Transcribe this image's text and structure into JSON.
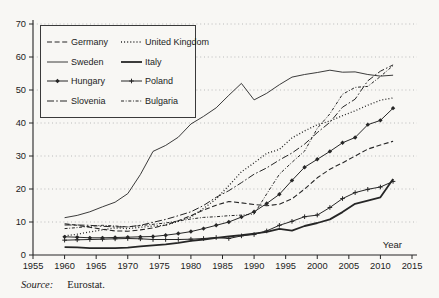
{
  "figure": {
    "source_label": "Source:",
    "source_value": "Eurostat.",
    "ink_color": "#262626",
    "grid_color": "#b3b3b3",
    "background": "#f8f7f4"
  },
  "chart_data": {
    "type": "line",
    "title": "",
    "xlabel": "Year",
    "ylabel": "",
    "xlim": [
      1955,
      2015
    ],
    "ylim": [
      0,
      70
    ],
    "x_ticks": [
      1955,
      1960,
      1965,
      1970,
      1975,
      1980,
      1985,
      1990,
      1995,
      2000,
      2005,
      2010,
      2015
    ],
    "y_ticks": [
      0,
      10,
      20,
      30,
      40,
      50,
      60,
      70
    ],
    "grid": "horizontal-dotted",
    "legend_position": "upper-left",
    "x": [
      1960,
      1962,
      1964,
      1966,
      1968,
      1970,
      1972,
      1974,
      1976,
      1978,
      1980,
      1982,
      1984,
      1986,
      1988,
      1990,
      1992,
      1994,
      1996,
      1998,
      2000,
      2002,
      2004,
      2006,
      2008,
      2010,
      2012
    ],
    "series": [
      {
        "name": "Germany",
        "style": "dashed",
        "marker": "none",
        "values": [
          9.5,
          9.0,
          8.4,
          7.8,
          7.3,
          7.2,
          7.6,
          8.2,
          9.1,
          10.4,
          11.9,
          13.6,
          15.1,
          16.2,
          15.8,
          15.3,
          14.9,
          15.4,
          17.0,
          20.0,
          23.4,
          26.0,
          27.9,
          30.0,
          32.1,
          33.3,
          34.5
        ]
      },
      {
        "name": "United Kingdom",
        "style": "dotted",
        "marker": "none",
        "values": [
          5.8,
          6.3,
          7.0,
          7.6,
          8.2,
          8.0,
          8.4,
          8.8,
          9.0,
          10.2,
          11.5,
          14.1,
          17.0,
          21.0,
          25.2,
          27.9,
          30.8,
          32.0,
          35.5,
          37.6,
          39.5,
          40.6,
          42.2,
          43.7,
          45.4,
          46.9,
          47.6
        ]
      },
      {
        "name": "Sweden",
        "style": "solid-thin",
        "marker": "none",
        "values": [
          11.3,
          12.0,
          13.1,
          14.6,
          16.0,
          18.6,
          24.4,
          31.4,
          33.2,
          35.7,
          39.7,
          42.0,
          44.6,
          48.4,
          52.0,
          47.0,
          49.0,
          51.6,
          53.9,
          54.7,
          55.3,
          56.0,
          55.4,
          55.5,
          54.7,
          54.2,
          54.5
        ]
      },
      {
        "name": "Italy",
        "style": "solid-thick",
        "marker": "none",
        "values": [
          2.4,
          2.3,
          2.1,
          2.1,
          2.1,
          2.2,
          2.6,
          2.9,
          3.2,
          3.7,
          4.3,
          4.7,
          5.2,
          5.6,
          6.0,
          6.5,
          7.0,
          7.9,
          7.4,
          8.8,
          9.7,
          10.8,
          13.0,
          15.5,
          16.5,
          17.5,
          23.0
        ]
      },
      {
        "name": "Hungary",
        "style": "solid",
        "marker": "diamond",
        "values": [
          5.5,
          5.4,
          5.2,
          5.2,
          5.3,
          5.4,
          5.5,
          5.6,
          6.0,
          6.5,
          7.1,
          8.0,
          9.0,
          10.0,
          11.5,
          13.1,
          15.6,
          18.4,
          22.6,
          26.6,
          29.0,
          31.4,
          34.0,
          35.6,
          39.5,
          40.8,
          44.5
        ]
      },
      {
        "name": "Poland",
        "style": "solid",
        "marker": "plus",
        "values": [
          4.5,
          4.6,
          4.7,
          4.8,
          4.9,
          5.0,
          4.9,
          4.7,
          4.7,
          4.7,
          4.8,
          5.0,
          5.3,
          5.0,
          5.8,
          6.2,
          7.3,
          9.0,
          10.2,
          11.6,
          12.1,
          14.4,
          17.1,
          18.9,
          19.9,
          20.6,
          22.3
        ]
      },
      {
        "name": "Slovenia",
        "style": "dashdot",
        "marker": "none",
        "values": [
          9.1,
          9.1,
          9.0,
          8.7,
          8.5,
          8.5,
          9.0,
          9.9,
          10.8,
          11.9,
          13.1,
          15.0,
          17.5,
          19.5,
          21.9,
          24.5,
          26.4,
          28.8,
          30.9,
          33.6,
          37.1,
          40.2,
          44.8,
          47.2,
          52.8,
          55.7,
          57.6
        ]
      },
      {
        "name": "Bulgaria",
        "style": "dashdotdot",
        "marker": "none",
        "values": [
          8.0,
          8.3,
          8.7,
          9.0,
          8.8,
          8.5,
          8.9,
          9.3,
          9.7,
          10.3,
          10.9,
          11.4,
          11.6,
          11.9,
          12.1,
          12.4,
          18.5,
          24.5,
          28.1,
          31.5,
          38.4,
          42.8,
          48.7,
          50.8,
          51.1,
          54.1,
          57.4
        ]
      }
    ]
  }
}
